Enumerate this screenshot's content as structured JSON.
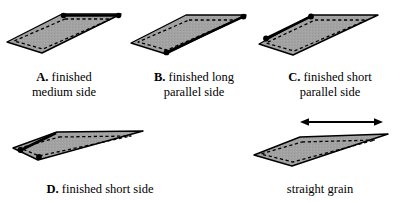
{
  "figure": {
    "title_fragment": "MAKE UP",
    "background_color": "#ffffff",
    "piece_fill_color": "#a3a3a3",
    "piece_outline_color": "#000000",
    "finished_edge_color": "#000000",
    "dashed_seamline_color": "#000000"
  },
  "captions": {
    "a": {
      "key": "A.",
      "text": "finished",
      "text2": "medium side"
    },
    "b": {
      "key": "B.",
      "text": "finished long",
      "text2": "parallel side"
    },
    "c": {
      "key": "C.",
      "text": "finished short",
      "text2": "parallel side"
    },
    "d": {
      "key": "D.",
      "text": "finished short side",
      "text2": ""
    },
    "grain": {
      "key": "",
      "text": "straight grain",
      "text2": ""
    }
  },
  "pieces": [
    {
      "id": "a",
      "label": "piece-a",
      "finished_edge": "top long edge",
      "endpoint_dots": 2
    },
    {
      "id": "b",
      "label": "piece-b",
      "finished_edge": "bottom long parallel edge",
      "endpoint_dots": 2
    },
    {
      "id": "c",
      "label": "piece-c",
      "finished_edge": "short left parallel edge",
      "endpoint_dots": 2
    },
    {
      "id": "d",
      "label": "piece-d",
      "finished_edge": "short left edge",
      "endpoint_dots": 2
    },
    {
      "id": "grain",
      "label": "piece-grain",
      "finished_edge": "none",
      "endpoint_dots": 0
    }
  ],
  "grain_arrow": {
    "name": "straight-grain-arrow",
    "direction": "horizontal double-headed"
  }
}
